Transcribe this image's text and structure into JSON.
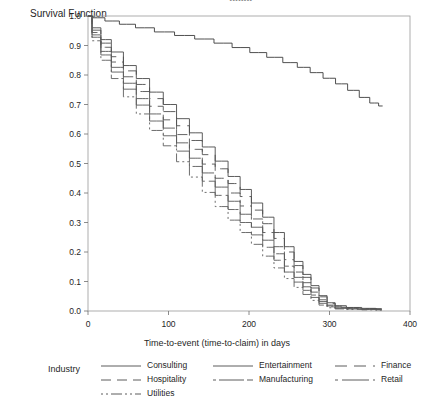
{
  "title_clipped": "••••••••",
  "axes": {
    "y_axis_title": "Survival Function",
    "x_axis_title": "Time-to-event (time-to-claim) in days",
    "y_ticks": [
      "0.0",
      "0.1",
      "0.2",
      "0.3",
      "0.4",
      "0.5",
      "0.6",
      "0.7",
      "0.8",
      "0.9",
      "1.0"
    ],
    "x_ticks": [
      "0",
      "100",
      "200",
      "300",
      "400"
    ]
  },
  "legend": {
    "title": "Industry",
    "columns": [
      [
        {
          "label": "Consulting",
          "dash": "none",
          "icon": "solid-line-swatch"
        },
        {
          "label": "Hospitality",
          "dash": "10 6",
          "icon": "long-dash-line-swatch"
        },
        {
          "label": "Utilities",
          "dash": "2 3 2 3 11 3",
          "icon": "dash-dot-line-swatch"
        }
      ],
      [
        {
          "label": "Entertainment",
          "dash": "none",
          "icon": "solid-line-swatch"
        },
        {
          "label": "Manufacturing",
          "dash": "3 3 22 0",
          "icon": "dash-long-line-swatch"
        }
      ],
      [
        {
          "label": "Finance",
          "dash": "12 7",
          "icon": "medium-dash-line-swatch"
        },
        {
          "label": "Retail",
          "dash": "3 4 24 0",
          "icon": "short-long-dash-line-swatch"
        }
      ]
    ]
  },
  "chart_data": {
    "type": "line",
    "title": "",
    "xlabel": "Time-to-event (time-to-claim) in days",
    "ylabel": "Survival Function",
    "xlim": [
      0,
      400
    ],
    "ylim": [
      0.0,
      1.0
    ],
    "grid": false,
    "legend_position": "bottom",
    "series": [
      {
        "name": "Entertainment",
        "dash": "none",
        "color": "#3c3c3c",
        "x": [
          0,
          12,
          30,
          48,
          70,
          95,
          120,
          145,
          168,
          190,
          212,
          232,
          252,
          268,
          284,
          300,
          315,
          330,
          344,
          356,
          366
        ],
        "y": [
          1.0,
          0.994,
          0.983,
          0.972,
          0.96,
          0.946,
          0.934,
          0.922,
          0.908,
          0.893,
          0.876,
          0.86,
          0.842,
          0.826,
          0.808,
          0.789,
          0.77,
          0.748,
          0.724,
          0.705,
          0.695
        ]
      },
      {
        "name": "Consulting",
        "dash": "none",
        "color": "#4a4a4a",
        "x": [
          0,
          10,
          22,
          36,
          52,
          68,
          85,
          102,
          118,
          134,
          150,
          166,
          182,
          196,
          210,
          224,
          238,
          250,
          262,
          272,
          282,
          292,
          302,
          312,
          330,
          350,
          365
        ],
        "y": [
          1.0,
          0.96,
          0.92,
          0.878,
          0.832,
          0.788,
          0.742,
          0.7,
          0.652,
          0.604,
          0.556,
          0.508,
          0.456,
          0.412,
          0.366,
          0.318,
          0.266,
          0.218,
          0.168,
          0.124,
          0.086,
          0.052,
          0.028,
          0.018,
          0.012,
          0.009,
          0.008
        ]
      },
      {
        "name": "Finance",
        "dash": "12 7",
        "color": "#4f4f4f",
        "x": [
          0,
          10,
          22,
          36,
          52,
          68,
          85,
          102,
          118,
          134,
          150,
          166,
          182,
          196,
          210,
          224,
          238,
          250,
          262,
          272,
          282,
          292,
          302,
          312,
          330,
          350,
          365
        ],
        "y": [
          1.0,
          0.952,
          0.908,
          0.862,
          0.814,
          0.768,
          0.72,
          0.676,
          0.628,
          0.578,
          0.53,
          0.482,
          0.432,
          0.388,
          0.342,
          0.296,
          0.246,
          0.2,
          0.154,
          0.114,
          0.078,
          0.048,
          0.026,
          0.016,
          0.011,
          0.008,
          0.007
        ]
      },
      {
        "name": "Hospitality",
        "dash": "10 6",
        "color": "#545454",
        "x": [
          0,
          10,
          22,
          36,
          52,
          68,
          85,
          102,
          118,
          134,
          150,
          166,
          182,
          196,
          210,
          224,
          238,
          250,
          262,
          272,
          282,
          292,
          302,
          312,
          330,
          350,
          365
        ],
        "y": [
          1.0,
          0.944,
          0.894,
          0.844,
          0.794,
          0.744,
          0.694,
          0.648,
          0.598,
          0.548,
          0.498,
          0.45,
          0.4,
          0.356,
          0.312,
          0.266,
          0.218,
          0.174,
          0.132,
          0.096,
          0.064,
          0.038,
          0.02,
          0.013,
          0.009,
          0.007,
          0.006
        ]
      },
      {
        "name": "Manufacturing",
        "dash": "3 3 22 0",
        "color": "#575757",
        "x": [
          0,
          10,
          22,
          36,
          52,
          68,
          85,
          102,
          118,
          134,
          150,
          166,
          182,
          196,
          210,
          224,
          238,
          250,
          262,
          272,
          282,
          292,
          302,
          312,
          330,
          350,
          365
        ],
        "y": [
          1.0,
          0.936,
          0.88,
          0.826,
          0.772,
          0.72,
          0.668,
          0.62,
          0.57,
          0.518,
          0.468,
          0.42,
          0.372,
          0.328,
          0.284,
          0.24,
          0.194,
          0.152,
          0.114,
          0.082,
          0.054,
          0.032,
          0.017,
          0.011,
          0.008,
          0.006,
          0.005
        ]
      },
      {
        "name": "Retail",
        "dash": "3 4 24 0",
        "color": "#5a5a5a",
        "x": [
          0,
          10,
          22,
          36,
          52,
          68,
          85,
          102,
          118,
          134,
          150,
          166,
          182,
          196,
          210,
          224,
          238,
          250,
          262,
          272,
          282,
          292,
          302,
          312,
          330,
          350,
          365
        ],
        "y": [
          1.0,
          0.928,
          0.868,
          0.81,
          0.752,
          0.698,
          0.644,
          0.594,
          0.542,
          0.49,
          0.44,
          0.392,
          0.344,
          0.3,
          0.258,
          0.216,
          0.172,
          0.132,
          0.098,
          0.07,
          0.046,
          0.026,
          0.014,
          0.009,
          0.007,
          0.005,
          0.004
        ]
      },
      {
        "name": "Utilities",
        "dash": "2 3 2 3 11 3",
        "color": "#5d5d5d",
        "x": [
          0,
          10,
          22,
          36,
          52,
          68,
          85,
          102,
          118,
          134,
          150,
          166,
          182,
          196,
          210,
          224,
          238,
          250,
          262,
          272,
          282,
          292,
          302,
          312,
          330,
          350,
          365
        ],
        "y": [
          1.0,
          0.916,
          0.85,
          0.788,
          0.726,
          0.668,
          0.612,
          0.56,
          0.506,
          0.454,
          0.402,
          0.354,
          0.308,
          0.266,
          0.226,
          0.186,
          0.146,
          0.11,
          0.08,
          0.056,
          0.036,
          0.02,
          0.011,
          0.007,
          0.005,
          0.004,
          0.003
        ]
      }
    ]
  }
}
